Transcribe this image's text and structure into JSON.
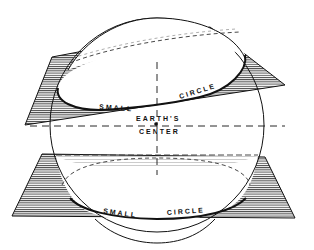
{
  "diagram": {
    "labels": {
      "upper_small_circle_left": "SMALL",
      "upper_small_circle_right": "CIRCLE",
      "center_line1": "EARTH'S",
      "center_line2": "CENTER",
      "lower_small_circle_left": "SMALL",
      "lower_small_circle_right": "CIRCLE"
    },
    "colors": {
      "ink": "#111111",
      "hatch": "#333333",
      "background": "#ffffff"
    }
  }
}
